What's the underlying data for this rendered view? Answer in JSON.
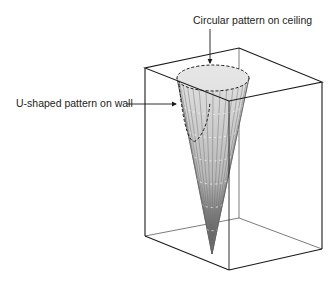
{
  "diagram": {
    "labels": {
      "ceiling": "Circular pattern on ceiling",
      "wall": "U-shaped pattern on wall"
    },
    "colors": {
      "line": "#1a1a1a",
      "cone_light": "#d8d8d8",
      "cone_dark": "#555555"
    }
  }
}
